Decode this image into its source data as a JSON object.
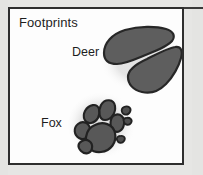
{
  "panel": {
    "title": "Footprints",
    "background_color": "#fdfdfd",
    "border_color": "#2e2e2e"
  },
  "page": {
    "background_color": "#e6e6e4",
    "margin_color": "#e4e4e2"
  },
  "tracks": [
    {
      "label": "Deer",
      "icon": "deer-hoofprint-icon",
      "description": "two elongated cloven hoof halves angled diagonally",
      "fill_color": "#5e5e5e",
      "outline_color": "#2a2a2a"
    },
    {
      "label": "Fox",
      "icon": "fox-pawprint-icon",
      "description": "rounded paw with four toe pads, central pad and claw marks",
      "fill_color": "#585858",
      "outline_color": "#262626"
    }
  ]
}
